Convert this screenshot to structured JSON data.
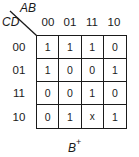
{
  "kmap": {
    "column_variables": "AB",
    "row_variables": "CD",
    "column_headers": [
      "00",
      "01",
      "11",
      "10"
    ],
    "row_headers": [
      "00",
      "01",
      "11",
      "10"
    ],
    "cells": [
      [
        "1",
        "1",
        "1",
        "0"
      ],
      [
        "1",
        "0",
        "0",
        "1"
      ],
      [
        "0",
        "0",
        "1",
        "0"
      ],
      [
        "0",
        "1",
        "x",
        "1"
      ]
    ],
    "output_label": {
      "base": "B",
      "superscript": "+"
    }
  }
}
